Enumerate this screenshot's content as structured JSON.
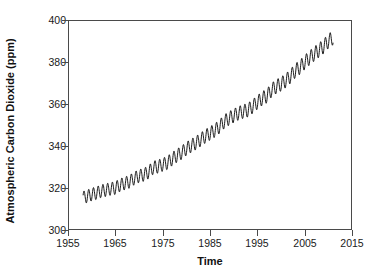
{
  "chart_data": {
    "type": "line",
    "title": "",
    "xlabel": "Time",
    "ylabel": "Atmospheric Carbon Dioxide (ppm)",
    "xlim": [
      1955,
      2015
    ],
    "ylim": [
      300,
      400
    ],
    "xticks": [
      1955,
      1965,
      1975,
      1985,
      1995,
      2005,
      2015
    ],
    "yticks": [
      300,
      320,
      340,
      360,
      380,
      400
    ],
    "grid": false,
    "legend": null,
    "line_color": "#000000",
    "series": [
      {
        "name": "Mauna Loa monthly mean CO2",
        "description": "Rising trend with annual seasonal oscillation (Keeling Curve)",
        "x_start": 1958.2,
        "x_end": 2011.0,
        "annual_amplitude_start": 3.0,
        "annual_amplitude_end": 3.4,
        "annual_means": [
          {
            "year": 1958,
            "value": 315.3
          },
          {
            "year": 1959,
            "value": 316.0
          },
          {
            "year": 1960,
            "value": 316.9
          },
          {
            "year": 1961,
            "value": 317.6
          },
          {
            "year": 1962,
            "value": 318.5
          },
          {
            "year": 1963,
            "value": 319.0
          },
          {
            "year": 1964,
            "value": 319.6
          },
          {
            "year": 1965,
            "value": 320.0
          },
          {
            "year": 1966,
            "value": 321.4
          },
          {
            "year": 1967,
            "value": 322.2
          },
          {
            "year": 1968,
            "value": 323.0
          },
          {
            "year": 1969,
            "value": 324.6
          },
          {
            "year": 1970,
            "value": 325.7
          },
          {
            "year": 1971,
            "value": 326.3
          },
          {
            "year": 1972,
            "value": 327.5
          },
          {
            "year": 1973,
            "value": 329.7
          },
          {
            "year": 1974,
            "value": 330.2
          },
          {
            "year": 1975,
            "value": 331.1
          },
          {
            "year": 1976,
            "value": 332.0
          },
          {
            "year": 1977,
            "value": 333.8
          },
          {
            "year": 1978,
            "value": 335.4
          },
          {
            "year": 1979,
            "value": 336.8
          },
          {
            "year": 1980,
            "value": 338.7
          },
          {
            "year": 1981,
            "value": 340.1
          },
          {
            "year": 1982,
            "value": 341.4
          },
          {
            "year": 1983,
            "value": 343.0
          },
          {
            "year": 1984,
            "value": 344.6
          },
          {
            "year": 1985,
            "value": 346.0
          },
          {
            "year": 1986,
            "value": 347.4
          },
          {
            "year": 1987,
            "value": 349.2
          },
          {
            "year": 1988,
            "value": 351.6
          },
          {
            "year": 1989,
            "value": 353.1
          },
          {
            "year": 1990,
            "value": 354.4
          },
          {
            "year": 1991,
            "value": 355.6
          },
          {
            "year": 1992,
            "value": 356.4
          },
          {
            "year": 1993,
            "value": 357.1
          },
          {
            "year": 1994,
            "value": 358.8
          },
          {
            "year": 1995,
            "value": 360.8
          },
          {
            "year": 1996,
            "value": 362.6
          },
          {
            "year": 1997,
            "value": 363.8
          },
          {
            "year": 1998,
            "value": 366.6
          },
          {
            "year": 1999,
            "value": 368.3
          },
          {
            "year": 2000,
            "value": 369.5
          },
          {
            "year": 2001,
            "value": 371.1
          },
          {
            "year": 2002,
            "value": 373.2
          },
          {
            "year": 2003,
            "value": 375.8
          },
          {
            "year": 2004,
            "value": 377.5
          },
          {
            "year": 2005,
            "value": 379.8
          },
          {
            "year": 2006,
            "value": 381.9
          },
          {
            "year": 2007,
            "value": 383.8
          },
          {
            "year": 2008,
            "value": 385.6
          },
          {
            "year": 2009,
            "value": 387.4
          },
          {
            "year": 2010,
            "value": 389.9
          },
          {
            "year": 2011,
            "value": 391.6
          }
        ]
      }
    ]
  },
  "axes": {
    "y": {
      "label": "Atmospheric Carbon Dioxide (ppm)",
      "ticks": [
        "400",
        "380",
        "360",
        "340",
        "320",
        "300"
      ]
    },
    "x": {
      "label": "Time",
      "ticks": [
        "1955",
        "1965",
        "1975",
        "1985",
        "1995",
        "2005",
        "2015"
      ]
    }
  }
}
